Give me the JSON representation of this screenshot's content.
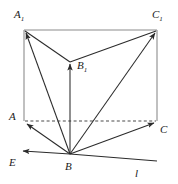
{
  "figure": {
    "stroke_color": "#2b2b2b",
    "light_stroke_color": "#8c8c8c",
    "background_color": "#ffffff",
    "labels": [
      {
        "id": "A1",
        "text": "A",
        "sub": "1",
        "x": 14,
        "y": 9
      },
      {
        "id": "C1",
        "text": "C",
        "sub": "1",
        "x": 152,
        "y": 9
      },
      {
        "id": "B1",
        "text": "B",
        "sub": "1",
        "x": 77,
        "y": 60
      },
      {
        "id": "A",
        "text": "A",
        "sub": "",
        "x": 9,
        "y": 111
      },
      {
        "id": "C",
        "text": "C",
        "sub": "",
        "x": 160,
        "y": 124
      },
      {
        "id": "E",
        "text": "E",
        "sub": "",
        "x": 9,
        "y": 157
      },
      {
        "id": "B",
        "text": "B",
        "sub": "",
        "x": 65,
        "y": 161
      },
      {
        "id": "l",
        "text": "l",
        "sub": "",
        "x": 135,
        "y": 168
      }
    ],
    "vertices": {
      "A1": {
        "x": 24,
        "y": 30
      },
      "C1": {
        "x": 157,
        "y": 30
      },
      "B1": {
        "x": 70,
        "y": 62
      },
      "A": {
        "x": 24,
        "y": 121
      },
      "C": {
        "x": 157,
        "y": 121
      },
      "B": {
        "x": 70,
        "y": 154
      },
      "E_tip": {
        "x": 21,
        "y": 151
      },
      "l_end": {
        "x": 157,
        "y": 161
      }
    },
    "edges": [
      {
        "name": "A1-C1",
        "kind": "solid-light",
        "arrow": "none"
      },
      {
        "name": "A1-A",
        "kind": "solid-light",
        "arrow": "none"
      },
      {
        "name": "C1-C",
        "kind": "solid-light",
        "arrow": "none"
      },
      {
        "name": "A-C",
        "kind": "dashed",
        "arrow": "none"
      },
      {
        "name": "B1-A1",
        "kind": "solid",
        "arrow": "none"
      },
      {
        "name": "B1-C1",
        "kind": "solid",
        "arrow": "none"
      },
      {
        "name": "B-A1",
        "kind": "solid",
        "arrow": "end"
      },
      {
        "name": "B-B1",
        "kind": "solid",
        "arrow": "end"
      },
      {
        "name": "B-C1",
        "kind": "solid",
        "arrow": "end"
      },
      {
        "name": "B-A",
        "kind": "solid",
        "arrow": "end"
      },
      {
        "name": "B-C",
        "kind": "solid",
        "arrow": "end"
      },
      {
        "name": "B-E",
        "kind": "solid",
        "arrow": "end"
      },
      {
        "name": "B-l",
        "kind": "solid",
        "arrow": "none"
      }
    ]
  }
}
